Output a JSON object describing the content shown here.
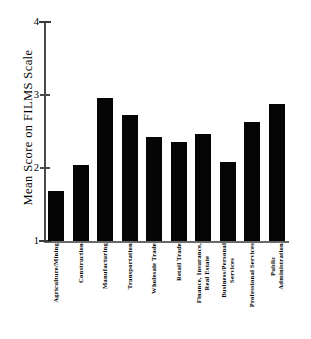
{
  "chart_data": {
    "type": "bar",
    "title": "",
    "xlabel": "",
    "ylabel": "Mean Score on FILMS Scale",
    "ylim": [
      1,
      4
    ],
    "yticks": [
      "1",
      "2",
      "3",
      "4"
    ],
    "ytick_values": [
      1,
      2,
      3,
      4
    ],
    "grid": false,
    "legend": false,
    "categories": [
      "Agriculture/Mining",
      "Construction",
      "Manufacturing",
      "Transportation",
      "Wholesale Trade",
      "Retail Trade",
      "Finance, Insurance, Real Estate",
      "Business/Personal Services",
      "Professional Services",
      "Public Administration"
    ],
    "category_lines": [
      [
        "Agriculture/Mining"
      ],
      [
        "Construction"
      ],
      [
        "Manufacturing"
      ],
      [
        "Transportation"
      ],
      [
        "Wholesale Trade"
      ],
      [
        "Retail Trade"
      ],
      [
        "Finance, Insurance,",
        "Real Estate"
      ],
      [
        "Business/Personal",
        "Services"
      ],
      [
        "Professional Services"
      ],
      [
        "Public",
        "Administration"
      ]
    ],
    "values": [
      1.69,
      2.04,
      2.96,
      2.72,
      2.42,
      2.35,
      2.47,
      2.08,
      2.63,
      2.88
    ],
    "bar_color": "#050505",
    "axis_color": "#4a4a4a",
    "background": "#ffffff"
  }
}
